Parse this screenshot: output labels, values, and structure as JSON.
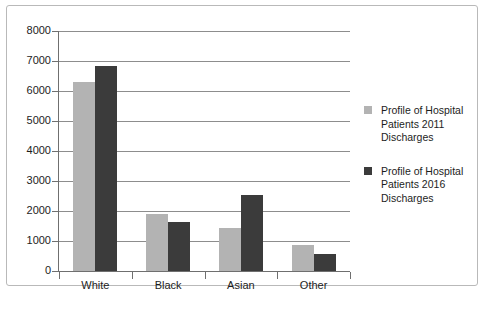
{
  "chart_data": {
    "type": "bar",
    "title": "",
    "xlabel": "",
    "ylabel": "",
    "ylim": [
      0,
      8000
    ],
    "ytick_step": 1000,
    "yticks": [
      "8000",
      "7000",
      "6000",
      "5000",
      "4000",
      "3000",
      "2000",
      "1000",
      "0"
    ],
    "grid": true,
    "legend_position": "right",
    "categories": [
      "White",
      "Black",
      "Asian",
      "Other"
    ],
    "series": [
      {
        "name": "Profile of Hospital Patients 2011 Discharges",
        "name_lines": [
          "Profile of Hospital",
          "Patients 2011",
          "Discharges"
        ],
        "color": "#b3b3b3",
        "values": [
          6300,
          1900,
          1450,
          880
        ]
      },
      {
        "name": "Profile of Hospital Patients 2016 Discharges",
        "name_lines": [
          "Profile of Hospital",
          "Patients 2016",
          "Discharges"
        ],
        "color": "#3b3b3b",
        "values": [
          6830,
          1630,
          2530,
          570
        ]
      }
    ]
  },
  "colors": {
    "series_2011": "#b3b3b3",
    "series_2016": "#3b3b3b",
    "gridline": "#8d8d8d",
    "axis": "#6f6f6f",
    "border": "#b9b9b9",
    "text": "#1d1d1d",
    "background": "#ffffff"
  }
}
